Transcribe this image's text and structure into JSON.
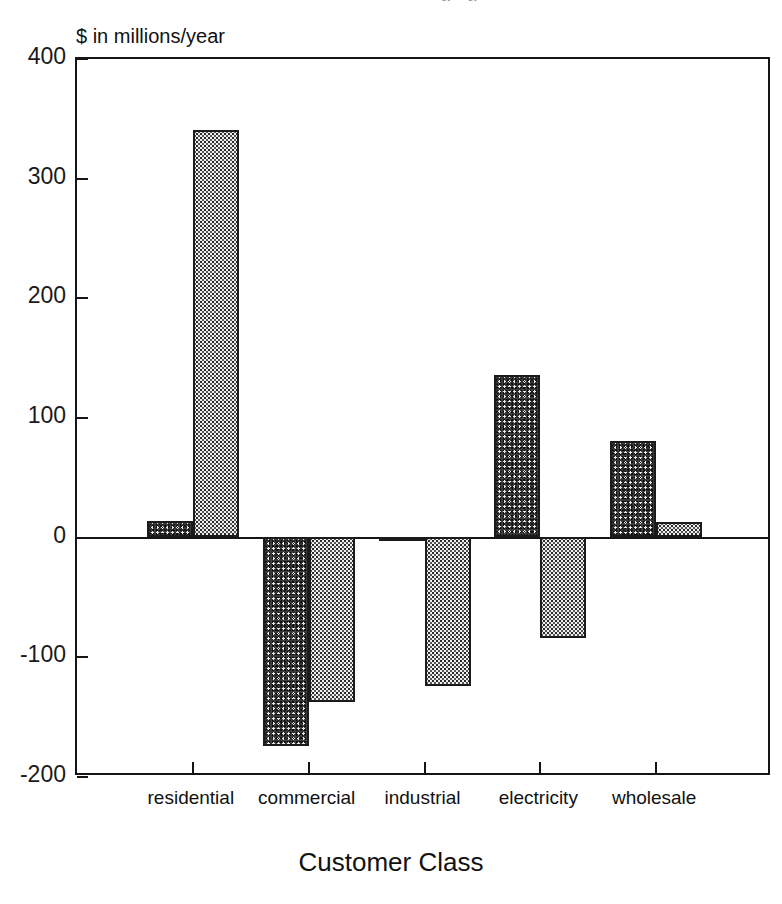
{
  "top_cut_text": "…gy …gy …",
  "axis": {
    "y_caption": "$ in millions/year",
    "x_title": "Customer Class",
    "y_ticks": [
      "400",
      "300",
      "200",
      "100",
      "0",
      "-100",
      "-200"
    ]
  },
  "chart_data": {
    "type": "bar",
    "title": "",
    "subtitle": "",
    "xlabel": "Customer Class",
    "ylabel": "$ in millions/year",
    "categories": [
      "residential",
      "commercial",
      "industrial",
      "electricity",
      "wholesale"
    ],
    "series": [
      {
        "name": "series-1-dark",
        "fill": "dark-stipple",
        "values": [
          13,
          -175,
          -4,
          135,
          80
        ]
      },
      {
        "name": "series-2-light",
        "fill": "light-dotted",
        "values": [
          340,
          -138,
          -125,
          -85,
          12
        ]
      }
    ],
    "ylim": [
      -200,
      400
    ],
    "ytick_step": 100,
    "grid": false,
    "legend": "none",
    "colors": {
      "series_1": "#3a3a3a",
      "series_2": "#eeeeec",
      "axis": "#151515",
      "background": "#ffffff"
    }
  }
}
